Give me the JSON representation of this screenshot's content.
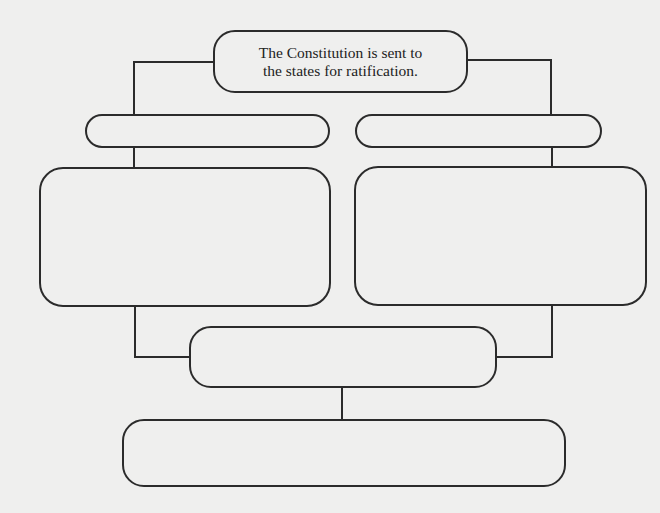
{
  "diagram": {
    "type": "flowchart",
    "background_color": "#efefee",
    "line_color": "#2b2b2b",
    "nodes": [
      {
        "id": "title",
        "label_line1": "The Constitution is sent to",
        "label_line2": "the states for ratification.",
        "shape": "rounded-rect"
      },
      {
        "id": "pill-left",
        "label": "",
        "shape": "pill"
      },
      {
        "id": "pill-right",
        "label": "",
        "shape": "pill"
      },
      {
        "id": "big-left",
        "label": "",
        "shape": "rounded-rect"
      },
      {
        "id": "big-right",
        "label": "",
        "shape": "rounded-rect"
      },
      {
        "id": "mid",
        "label": "",
        "shape": "rounded-rect"
      },
      {
        "id": "bottom",
        "label": "",
        "shape": "rounded-rect"
      }
    ],
    "edges": [
      {
        "from": "title",
        "to": "pill-left"
      },
      {
        "from": "title",
        "to": "pill-right"
      },
      {
        "from": "pill-left",
        "to": "big-left"
      },
      {
        "from": "pill-right",
        "to": "big-right"
      },
      {
        "from": "big-left",
        "to": "mid"
      },
      {
        "from": "big-right",
        "to": "mid"
      },
      {
        "from": "mid",
        "to": "bottom"
      }
    ]
  }
}
